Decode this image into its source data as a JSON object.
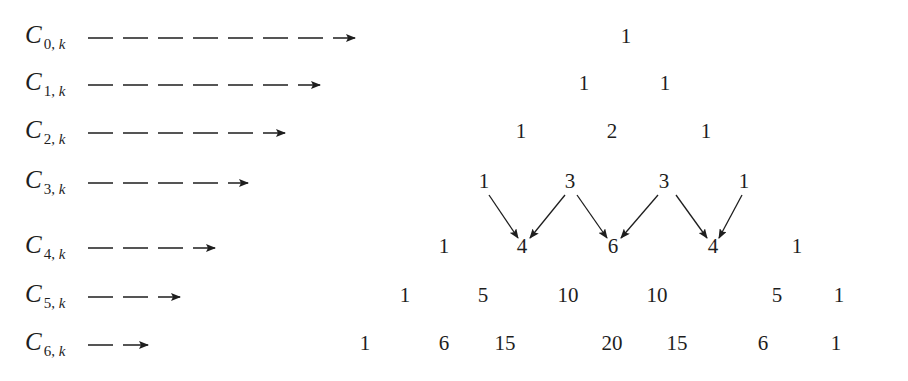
{
  "label_letter": "C",
  "label_index_var": "k",
  "rows": [
    {
      "n": "0",
      "values": [
        "1"
      ]
    },
    {
      "n": "1",
      "values": [
        "1",
        "1"
      ]
    },
    {
      "n": "2",
      "values": [
        "1",
        "2",
        "1"
      ]
    },
    {
      "n": "3",
      "values": [
        "1",
        "3",
        "3",
        "1"
      ]
    },
    {
      "n": "4",
      "values": [
        "1",
        "4",
        "6",
        "4",
        "1"
      ]
    },
    {
      "n": "5",
      "values": [
        "1",
        "5",
        "10",
        "10",
        "5",
        "1"
      ]
    },
    {
      "n": "6",
      "values": [
        "1",
        "6",
        "15",
        "20",
        "15",
        "6",
        "1"
      ]
    }
  ],
  "highlighted_additions": {
    "from_row": 3,
    "to_row": 4,
    "description": "Each entry in row 4 is the sum of the two entries above it: 1+3=4, 3+3=6, 3+1=4"
  }
}
